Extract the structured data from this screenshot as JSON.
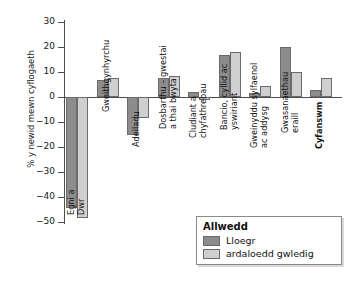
{
  "chart_data": {
    "type": "bar",
    "title": "",
    "xlabel": "",
    "ylabel": "% y newid mewn cyflogaeth",
    "ylim": [
      -50,
      30
    ],
    "yticks": [
      30,
      20,
      10,
      0,
      -10,
      -20,
      -30,
      -40,
      -50
    ],
    "ytick_labels": [
      "30",
      "20",
      "10",
      "0",
      "−10",
      "−20",
      "−30",
      "−40",
      "−50"
    ],
    "grid": false,
    "legend_position": "bottom-right",
    "categories": [
      "Egni a\nDwr",
      "Gweithgynhyrchu",
      "Adeiladu",
      "Dosbarthu – gwestai\na thai bwyta",
      "Cludiant a\nchyfathrebau",
      "Bancio, cyllid ac\nyswiriant",
      "Gweinyddu sylfaenol\nac addysg",
      "Gwasanaethau\neraill",
      "Cyfanswm"
    ],
    "series": [
      {
        "name": "Lloegr",
        "color": "#8c8c8c",
        "values": [
          -44.5,
          6.8,
          -15.0,
          7.6,
          2.0,
          17.0,
          1.5,
          20.0,
          3.0
        ]
      },
      {
        "name": "ardaloedd gwledig",
        "color": "#cfcfcf",
        "values": [
          -48.5,
          7.6,
          -8.4,
          8.4,
          -1.0,
          18.0,
          4.5,
          10.0,
          7.5
        ]
      }
    ]
  },
  "legend": {
    "title": "Allwedd",
    "entries": [
      {
        "label": "Lloegr",
        "color": "#8c8c8c"
      },
      {
        "label": "ardaloedd gwledig",
        "color": "#cfcfcf"
      }
    ]
  }
}
